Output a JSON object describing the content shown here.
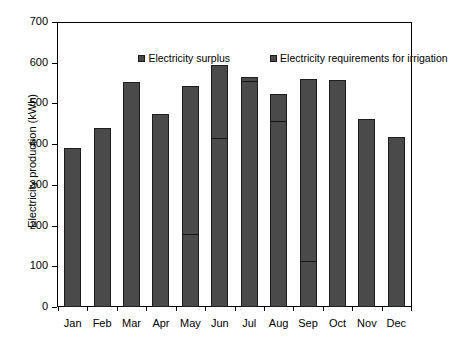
{
  "chart_data": {
    "type": "bar",
    "subtype": "stacked-bar",
    "title": "",
    "xlabel": "",
    "ylabel": "Electricity production (kWh)",
    "ylim": [
      0,
      700
    ],
    "yticks": [
      0,
      100,
      200,
      300,
      400,
      500,
      600,
      700
    ],
    "ytick_labels": [
      "0",
      "100",
      "200",
      "300",
      "400",
      "500",
      "600",
      "700"
    ],
    "grid": false,
    "legend_position": "top-inside",
    "categories": [
      "Jan",
      "Feb",
      "Mar",
      "Apr",
      "May",
      "Jun",
      "Jul",
      "Aug",
      "Sep",
      "Oct",
      "Nov",
      "Dec"
    ],
    "series": [
      {
        "name": "Electricity requirements for irrigation",
        "color": "#4a4a4a",
        "values": [
          0,
          0,
          0,
          0,
          177,
          412,
          553,
          455,
          110,
          0,
          0,
          0
        ]
      },
      {
        "name": "Electricity surplus",
        "color": "#4a4a4a",
        "values": [
          390,
          440,
          553,
          473,
          365,
          183,
          12,
          67,
          450,
          558,
          462,
          417
        ]
      }
    ],
    "totals": [
      390,
      440,
      553,
      473,
      542,
      595,
      565,
      522,
      560,
      558,
      462,
      417
    ],
    "bar_edge_color": "#1d1d1d",
    "axis_color": "#000000",
    "background_color": "#ffffff"
  },
  "legend": {
    "items": [
      {
        "label": "Electricity surplus",
        "swatch": "legend-swatch-square",
        "color": "#4a4a4a"
      },
      {
        "label": "Electricity requirements for irrigation",
        "swatch": "legend-swatch-square",
        "color": "#4a4a4a"
      }
    ]
  },
  "axes": {
    "y_title": "Electricity production (kWh)"
  }
}
